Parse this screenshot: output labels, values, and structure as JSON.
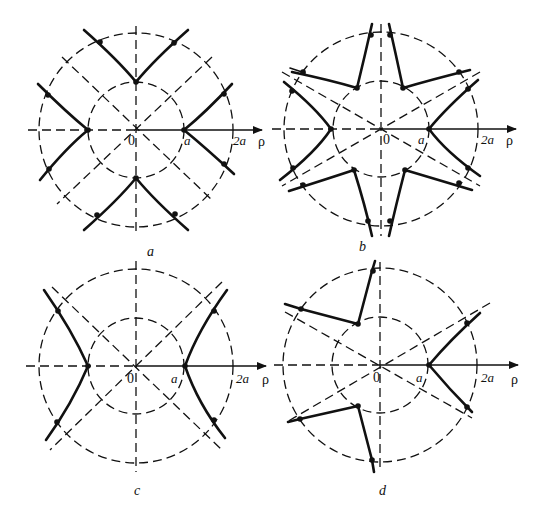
{
  "figure": {
    "panels": [
      {
        "id": "a",
        "caption": "a",
        "origin_label": "0",
        "tick_a_label": "a",
        "tick_2a_label": "2a",
        "axis_label": "ρ",
        "symmetry": "fourfold, branches on 4 axes"
      },
      {
        "id": "b",
        "caption": "b",
        "origin_label": "0",
        "tick_a_label": "a",
        "tick_2a_label": "2a",
        "axis_label": "ρ",
        "symmetry": "sixfold"
      },
      {
        "id": "c",
        "caption": "c",
        "origin_label": "0",
        "tick_a_label": "a",
        "tick_2a_label": "2a",
        "axis_label": "ρ",
        "symmetry": "twofold, hyperbola"
      },
      {
        "id": "d",
        "caption": "d",
        "origin_label": "0",
        "tick_a_label": "a",
        "tick_2a_label": "2a",
        "axis_label": "ρ",
        "symmetry": "threefold"
      }
    ],
    "colors": {
      "ink": "#111111",
      "background": "#ffffff"
    }
  }
}
